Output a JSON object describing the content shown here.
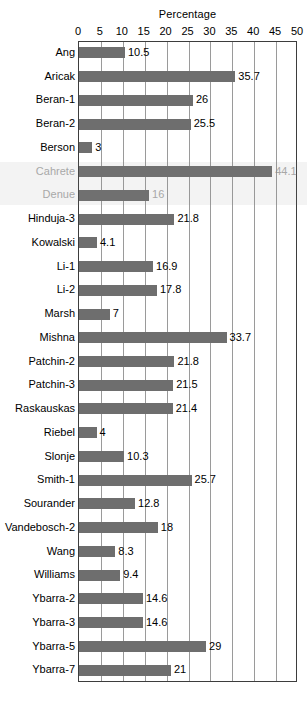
{
  "chart_data": {
    "type": "bar",
    "orientation": "horizontal",
    "title": "Percentage",
    "xlabel": "Percentage",
    "ylabel": "",
    "xlim": [
      0,
      50
    ],
    "xticks": [
      0,
      5,
      10,
      15,
      20,
      25,
      30,
      35,
      40,
      45,
      50
    ],
    "tick_labels": [
      "0",
      "5",
      "10",
      "15",
      "20",
      "25",
      "30",
      "35",
      "40",
      "45",
      "50"
    ],
    "grid": true,
    "legend": false,
    "bar_color": "#6e6e6e",
    "categories": [
      "Ang",
      "Aricak",
      "Beran-1",
      "Beran-2",
      "Berson",
      "Cahrete",
      "Denue",
      "Hinduja-3",
      "Kowalski",
      "Li-1",
      "Li-2",
      "Marsh",
      "Mishna",
      "Patchin-2",
      "Patchin-3",
      "Raskauskas",
      "Riebel",
      "Slonje",
      "Smith-1",
      "Sourander",
      "Vandebosch-2",
      "Wang",
      "Williams",
      "Ybarra-2",
      "Ybarra-3",
      "Ybarra-5",
      "Ybarra-7"
    ],
    "values": [
      10.5,
      35.7,
      26,
      25.5,
      3,
      44.1,
      16,
      21.8,
      4.1,
      16.9,
      17.8,
      7,
      33.7,
      21.8,
      21.5,
      21.4,
      4,
      10.3,
      25.7,
      12.8,
      18,
      8.3,
      9.4,
      14.6,
      14.6,
      29,
      21
    ],
    "value_labels": [
      "10.5",
      "35.7",
      "26",
      "25.5",
      "3",
      "44.1",
      "16",
      "21.8",
      "4.1",
      "16.9",
      "17.8",
      "7",
      "33.7",
      "21.8",
      "21.5",
      "21.4",
      "4",
      "10.3",
      "25.7",
      "12.8",
      "18",
      "8.3",
      "9.4",
      "14.6",
      "14.6",
      "29",
      "21"
    ],
    "degraded_rows": [
      5,
      6
    ]
  }
}
